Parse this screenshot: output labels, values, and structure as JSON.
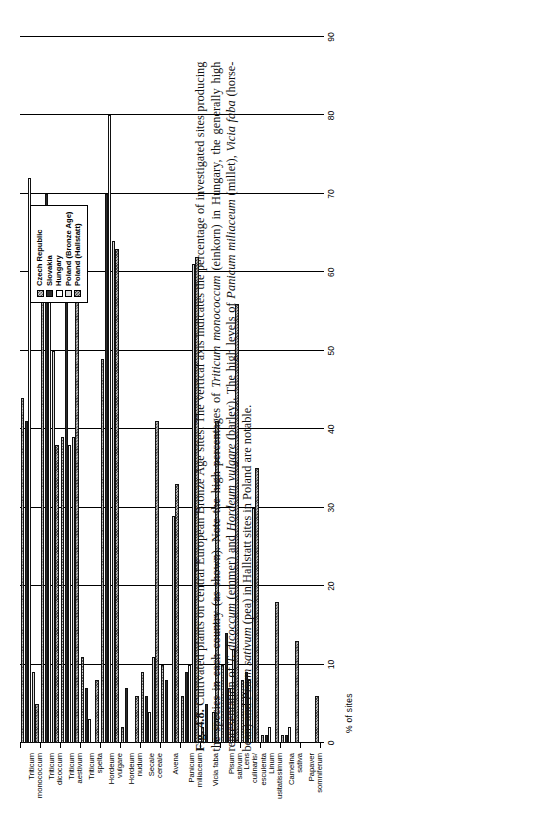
{
  "figure": {
    "number": "Fig. 4.8.",
    "caption_text": "Cultivated plants on central European Bronze Age sites. The vertical axis indicates the percentage of investigated sites producing the species in each country (as shown). Note the high percentages of Triticum monococcum (einkorn) in Hungary, the generally high representation of T. dicoccum (emmer) and Hordeum vulgare (barley). The high levels of Panicum miliaceum (millet), Vicia faba (horse-bean) and Pisum sativum (pea) in Hallstatt sites in Poland are notable."
  },
  "legend": {
    "position": "top-right",
    "items": [
      {
        "label": "Czech Republic",
        "swatch": "crosshatch-grey",
        "color": "#8e8e8e"
      },
      {
        "label": "Slovakia",
        "swatch": "solid-black",
        "color": "#2b2b2b"
      },
      {
        "label": "Hungary",
        "swatch": "white",
        "color": "#ffffff"
      },
      {
        "label": "Poland (Bronze Age)",
        "swatch": "light-grey",
        "color": "#dcdcdc"
      },
      {
        "label": "Poland (Hallstatt)",
        "swatch": "crosshatch-dark-grey",
        "color": "#6f6f6f"
      }
    ]
  },
  "chart_data": {
    "type": "bar",
    "orientation": "vertical-bars-rotated",
    "title": "",
    "xlabel": "",
    "ylabel": "% of sites",
    "ylim": [
      0,
      90
    ],
    "yticks": [
      0,
      10,
      20,
      30,
      40,
      50,
      60,
      70,
      80,
      90
    ],
    "grid": true,
    "categories": [
      "Triticum monococcum",
      "Triticum dicoccum",
      "Triticum aestivum",
      "Triticum spelta",
      "Hordeum vulgare",
      "Hordeum nudum",
      "Secale cereale",
      "Avena",
      "Panicum miliaceum",
      "Vicia faba",
      "Pisum sativum",
      "Lens culinaris/esculenta",
      "Linum usitatissimum",
      "Camelina sativa",
      "Papaver somniferum"
    ],
    "series": [
      {
        "name": "Czech Republic",
        "values": [
          44,
          58,
          39,
          11,
          49,
          2,
          9,
          10,
          6,
          2,
          10,
          8,
          1,
          1,
          0
        ]
      },
      {
        "name": "Slovakia",
        "values": [
          41,
          70,
          62,
          7,
          70,
          7,
          6,
          8,
          9,
          5,
          14,
          9,
          1,
          1,
          0
        ]
      },
      {
        "name": "Hungary",
        "values": [
          72,
          64,
          38,
          3,
          80,
          0,
          4,
          0,
          10,
          0,
          7,
          8,
          2,
          2,
          0
        ]
      },
      {
        "name": "Poland (Bronze Age)",
        "values": [
          9,
          50,
          39,
          0,
          64,
          0,
          11,
          29,
          61,
          4,
          12,
          30,
          0,
          0,
          0
        ]
      },
      {
        "name": "Poland (Hallstatt)",
        "values": [
          5,
          38,
          57,
          8,
          63,
          6,
          41,
          33,
          62,
          41,
          56,
          35,
          18,
          13,
          6
        ]
      }
    ]
  }
}
